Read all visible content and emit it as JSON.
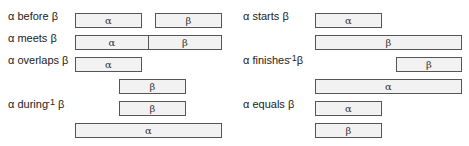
{
  "symbols": {
    "alpha": "α",
    "beta": "β"
  },
  "relations": [
    {
      "id": "before",
      "label_pre": "α before ",
      "label_sup": "",
      "label_post": "β",
      "bars": [
        {
          "text": "α"
        },
        {
          "text": "β"
        }
      ]
    },
    {
      "id": "meets",
      "label_pre": "α meets ",
      "label_sup": "",
      "label_post": "β",
      "bars": [
        {
          "text": "α"
        },
        {
          "text": "β"
        }
      ]
    },
    {
      "id": "overlaps",
      "label_pre": "α overlaps ",
      "label_sup": "",
      "label_post": "β",
      "bars": [
        {
          "text": "α"
        },
        {
          "text": "β"
        }
      ]
    },
    {
      "id": "during-inverse",
      "label_pre": "α during",
      "label_sup": "-1",
      "label_post": " β",
      "bars": [
        {
          "text": "β"
        },
        {
          "text": "α"
        }
      ]
    },
    {
      "id": "starts",
      "label_pre": "α starts ",
      "label_sup": "",
      "label_post": "β",
      "bars": [
        {
          "text": "α"
        },
        {
          "text": "β"
        }
      ]
    },
    {
      "id": "finishes-inverse",
      "label_pre": "α finishes",
      "label_sup": "-1",
      "label_post": "β",
      "bars": [
        {
          "text": "β"
        },
        {
          "text": "α"
        }
      ]
    },
    {
      "id": "equals",
      "label_pre": "α equals ",
      "label_sup": "",
      "label_post": "β",
      "bars": [
        {
          "text": "α"
        },
        {
          "text": "β"
        }
      ]
    }
  ]
}
